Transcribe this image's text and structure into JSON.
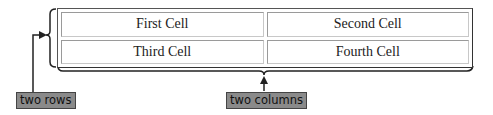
{
  "table": {
    "rows": [
      [
        "First Cell",
        "Second Cell"
      ],
      [
        "Third Cell",
        "Fourth Cell"
      ]
    ]
  },
  "annotations": {
    "rows_label": "two rows",
    "columns_label": "two columns"
  },
  "colors": {
    "label_bg": "#8a8a8a",
    "border": "#555555"
  }
}
